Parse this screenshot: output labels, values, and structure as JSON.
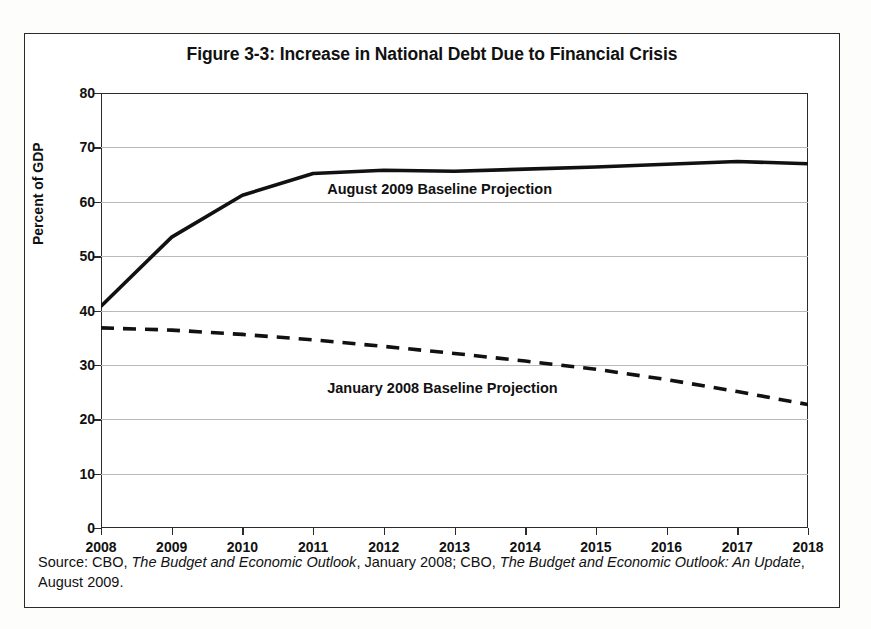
{
  "figure": {
    "title": "Figure 3-3: Increase in National Debt Due to Financial Crisis",
    "source_prefix": "Source: CBO, ",
    "source_title_1": "The Budget and Economic Outlook",
    "source_middle": ", January 2008; CBO, ",
    "source_title_2": "The Budget and Economic Outlook: An Update",
    "source_suffix": ", August 2009."
  },
  "chart_data": {
    "type": "line",
    "title": "Figure 3-3: Increase in National Debt Due to Financial Crisis",
    "xlabel": "",
    "ylabel": "Percent of GDP",
    "x": [
      2008,
      2009,
      2010,
      2011,
      2012,
      2013,
      2014,
      2015,
      2016,
      2017,
      2018
    ],
    "xtick_labels": [
      "2008",
      "2009",
      "2010",
      "2011",
      "2012",
      "2013",
      "2014",
      "2015",
      "2016",
      "2017",
      "2018"
    ],
    "ytick_labels": [
      "0",
      "10",
      "20",
      "30",
      "40",
      "50",
      "60",
      "70",
      "80"
    ],
    "yticks": [
      0,
      10,
      20,
      30,
      40,
      50,
      60,
      70,
      80
    ],
    "ylim": [
      0,
      80
    ],
    "xlim": [
      2008,
      2018
    ],
    "grid": true,
    "legend_position": "inline-annotation",
    "series": [
      {
        "name": "August 2009 Baseline Projection",
        "style": "solid",
        "color": "#111111",
        "values": [
          40.8,
          53.5,
          61.2,
          65.2,
          65.8,
          65.6,
          66.0,
          66.4,
          66.9,
          67.4,
          67.0
        ]
      },
      {
        "name": "January 2008 Baseline Projection",
        "style": "dashed",
        "color": "#111111",
        "values": [
          36.8,
          36.4,
          35.6,
          34.6,
          33.4,
          32.1,
          30.7,
          29.2,
          27.3,
          25.1,
          22.7
        ]
      }
    ],
    "annotations": [
      {
        "text": "August 2009 Baseline Projection",
        "x": 2011.2,
        "y": 62.2
      },
      {
        "text": "January 2008 Baseline Projection",
        "x": 2011.2,
        "y": 25.5
      }
    ]
  }
}
